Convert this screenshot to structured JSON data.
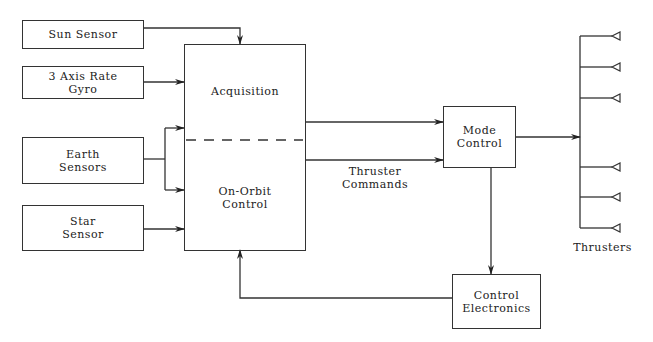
{
  "diagram": {
    "title": "",
    "blocks": {
      "sun_sensor": "Sun Sensor",
      "rate_gyro": "3 Axis Rate\nGyro",
      "earth_sensors": "Earth\nSensors",
      "star_sensor": "Star\nSensor",
      "acquisition": "Acquisition",
      "on_orbit_control": "On-Orbit\nControl",
      "mode_control": "Mode\nControl",
      "control_electronics": "Control\nElectronics"
    },
    "labels": {
      "thruster_commands": "Thruster\nCommands",
      "thrusters": "Thrusters"
    },
    "thruster_count": 6,
    "connections": [
      {
        "from": "Sun Sensor",
        "to": "Acquisition"
      },
      {
        "from": "3 Axis Rate Gyro",
        "to": "Acquisition"
      },
      {
        "from": "Earth Sensors",
        "to": "Acquisition"
      },
      {
        "from": "Earth Sensors",
        "to": "On-Orbit Control"
      },
      {
        "from": "Star Sensor",
        "to": "On-Orbit Control"
      },
      {
        "from": "Acquisition",
        "to": "Mode Control"
      },
      {
        "from": "On-Orbit Control",
        "to": "Mode Control",
        "label": "Thruster Commands"
      },
      {
        "from": "Mode Control",
        "to": "Thrusters"
      },
      {
        "from": "Mode Control",
        "to": "Control Electronics"
      },
      {
        "from": "Control Electronics",
        "to": "On-Orbit Control"
      }
    ]
  }
}
